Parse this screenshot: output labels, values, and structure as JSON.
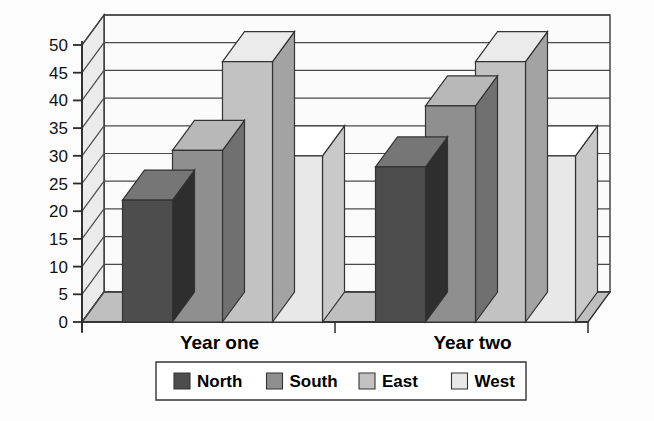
{
  "chart_data": {
    "type": "bar",
    "title": "",
    "subtitle": "",
    "xlabel": "",
    "ylabel": "",
    "categories": [
      "Year one",
      "Year two"
    ],
    "series": [
      {
        "name": "North",
        "values": [
          22,
          28
        ],
        "color": "#4d4d4d"
      },
      {
        "name": "South",
        "values": [
          31,
          39
        ],
        "color": "#8f8f8f"
      },
      {
        "name": "East",
        "values": [
          47,
          47
        ],
        "color": "#c2c2c2"
      },
      {
        "name": "West",
        "values": [
          30,
          30
        ],
        "color": "#e8e8e8"
      }
    ],
    "ylim": [
      0,
      50
    ],
    "yticks": [
      0,
      5,
      10,
      15,
      20,
      25,
      30,
      35,
      40,
      45,
      50
    ],
    "ytick_labels": [
      "0",
      "5",
      "10",
      "15",
      "20",
      "25",
      "30",
      "35",
      "40",
      "45",
      "50"
    ],
    "grid": true,
    "grid_axis": "y",
    "legend": {
      "position": "bottom",
      "entries": [
        {
          "label": "North",
          "color": "#4d4d4d"
        },
        {
          "label": "South",
          "color": "#8f8f8f"
        },
        {
          "label": "East",
          "color": "#c2c2c2"
        },
        {
          "label": "West",
          "color": "#e8e8e8"
        }
      ]
    },
    "style": {
      "three_d": true,
      "plot_back_wall_color": "#fbfbfb",
      "plot_side_wall_color": "#ebebeb",
      "plot_floor_color": "#bfbfbf",
      "axis_line_color": "#2b2b2b",
      "grid_line_color": "#4a4a4a",
      "bar_outline_color": "#333333",
      "background_color": "#fdfdfd"
    }
  }
}
